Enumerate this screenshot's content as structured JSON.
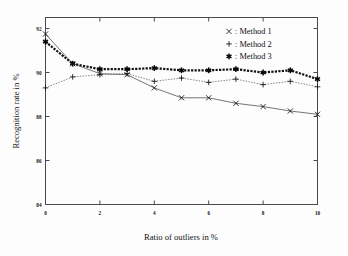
{
  "chart_data": {
    "type": "line",
    "title": "",
    "xlabel": "Ratio of outliers in %",
    "ylabel": "Recognition rate in %",
    "xlim": [
      0,
      10
    ],
    "ylim": [
      84,
      92.5
    ],
    "xticks": [
      "0",
      "2",
      "4",
      "6",
      "8",
      "10"
    ],
    "xtick_values": [
      0,
      2,
      4,
      6,
      8,
      10
    ],
    "yticks": [
      "84",
      "86",
      "88",
      "90",
      "92"
    ],
    "ytick_values": [
      84,
      86,
      88,
      90,
      92
    ],
    "grid": false,
    "legend_position": "top-right",
    "x": [
      0,
      1,
      2,
      3,
      4,
      5,
      6,
      7,
      8,
      9,
      10
    ],
    "series": [
      {
        "name": "Method 1",
        "marker": "x",
        "legend_marker": "×",
        "legend_label": ": Method 1",
        "linestyle": "solid-thin",
        "values": [
          91.75,
          90.4,
          89.95,
          89.9,
          89.3,
          88.85,
          88.85,
          88.6,
          88.45,
          88.25,
          88.1
        ]
      },
      {
        "name": "Method 2",
        "marker": "+",
        "legend_marker": "+",
        "legend_label": ": Method 2",
        "linestyle": "dotted-thin",
        "values": [
          89.3,
          89.8,
          89.9,
          89.95,
          89.6,
          89.75,
          89.55,
          89.7,
          89.45,
          89.6,
          89.35
        ]
      },
      {
        "name": "Method 3",
        "marker": "✳",
        "legend_marker": "✳",
        "legend_label": ": Method 3",
        "linestyle": "dotted-thick",
        "values": [
          91.4,
          90.4,
          90.15,
          90.15,
          90.2,
          90.1,
          90.1,
          90.15,
          90.0,
          90.1,
          89.7
        ]
      }
    ]
  },
  "legend": {
    "entries": [
      {
        "marker": "×",
        "label": ": Method 1"
      },
      {
        "marker": "+",
        "label": ": Method 2"
      },
      {
        "marker": "✳",
        "label": ": Method 3"
      }
    ]
  },
  "axes": {
    "x_title": "Ratio of outliers in %",
    "y_title": "Recognition rate in %"
  }
}
